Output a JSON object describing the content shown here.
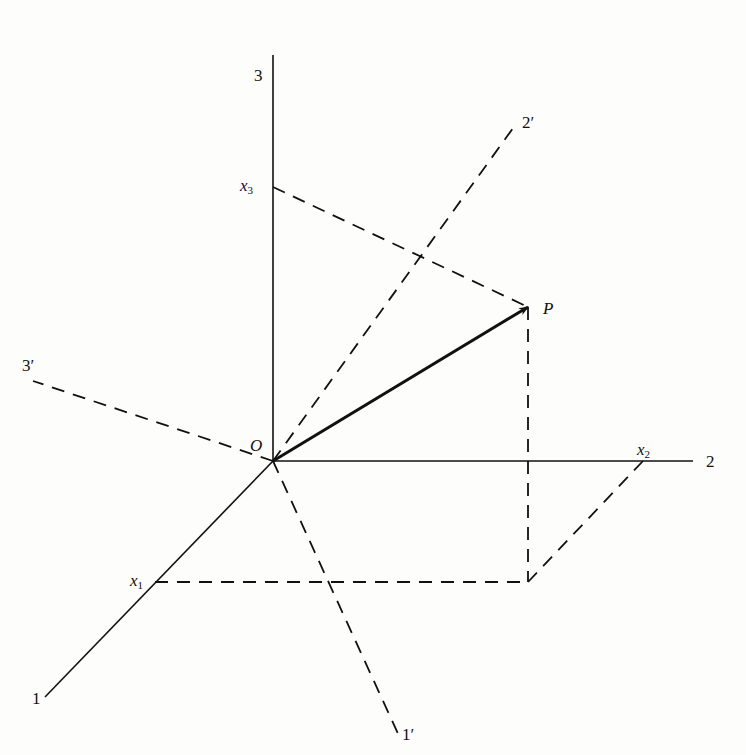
{
  "figure": {
    "labels": {
      "axis1": "1",
      "axis2": "2",
      "axis3": "3",
      "axis1_prime": "1′",
      "axis2_prime": "2′",
      "axis3_prime": "3′",
      "origin": "O",
      "point": "P",
      "x1_var": "x",
      "x1_sub": "1",
      "x2_var": "x",
      "x2_sub": "2",
      "x3_var": "x",
      "x3_sub": "3"
    },
    "geometry": {
      "origin": [
        273,
        461
      ],
      "axes_solid": [
        {
          "name": "axis-1",
          "from": [
            273,
            461
          ],
          "to": [
            45,
            697
          ]
        },
        {
          "name": "axis-2",
          "from": [
            273,
            461
          ],
          "to": [
            693,
            461
          ]
        },
        {
          "name": "axis-3",
          "from": [
            273,
            461
          ],
          "to": [
            273,
            55
          ]
        }
      ],
      "axes_dashed": [
        {
          "name": "axis-1-prime",
          "from": [
            273,
            461
          ],
          "to": [
            400,
            738
          ]
        },
        {
          "name": "axis-2-prime",
          "from": [
            273,
            461
          ],
          "to": [
            516,
            124
          ]
        },
        {
          "name": "axis-3-prime",
          "from": [
            273,
            461
          ],
          "to": [
            33,
            381
          ]
        }
      ],
      "projections_dashed": [
        {
          "name": "x3-to-P",
          "from": [
            273,
            187
          ],
          "to": [
            528,
            307
          ]
        },
        {
          "name": "P-to-base",
          "from": [
            528,
            307
          ],
          "to": [
            528,
            582
          ]
        },
        {
          "name": "x1-to-base",
          "from": [
            155,
            582
          ],
          "to": [
            528,
            582
          ]
        },
        {
          "name": "x2-to-base",
          "from": [
            643,
            461
          ],
          "to": [
            528,
            582
          ]
        }
      ],
      "vector_OP": {
        "from": [
          273,
          461
        ],
        "to": [
          528,
          307
        ]
      }
    }
  }
}
